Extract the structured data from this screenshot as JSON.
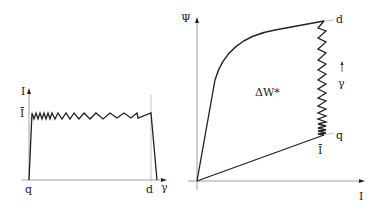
{
  "left_panel": {
    "y_axis_label": "I",
    "y_level_label": "Ī",
    "x_start_label": "q",
    "x_end_label": "d",
    "x_axis_label": "γ"
  },
  "right_panel": {
    "y_axis_label": "Ψ",
    "x_axis_label": "I",
    "top_point_label": "d",
    "bottom_point_label": "q",
    "bottom_value_label": "Ī",
    "direction_label": "γ",
    "area_label": "ΔW*"
  },
  "colors": {
    "line": "#222222",
    "axis": "#888888",
    "background": "#ffffff"
  }
}
